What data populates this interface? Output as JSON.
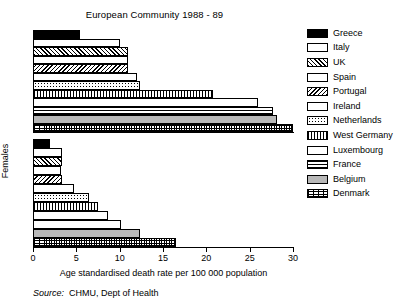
{
  "chart_data": {
    "type": "bar",
    "orientation": "horizontal",
    "title": "European Community 1988 - 89",
    "xlabel": "Age standardised death rate per 100 000 population",
    "ylabel": "",
    "xlim": [
      0,
      30
    ],
    "xticks": [
      0,
      5,
      10,
      15,
      20,
      25,
      30
    ],
    "xtick_labels": [
      "0",
      "5",
      "10",
      "15",
      "20",
      "25",
      "30"
    ],
    "grid": false,
    "legend_position": "right",
    "categories": [
      "Greece",
      "Italy",
      "UK",
      "Spain",
      "Portugal",
      "Ireland",
      "Netherlands",
      "West Germany",
      "Luxembourg",
      "France",
      "Belgium",
      "Denmark"
    ],
    "panels": [
      {
        "name": "Males",
        "label": "Males",
        "values": [
          5.4,
          10.0,
          11.0,
          11.0,
          11.0,
          12.0,
          12.4,
          20.8,
          26.0,
          27.7,
          28.2,
          30.0
        ]
      },
      {
        "name": "Females",
        "label": "Females",
        "values": [
          2.0,
          3.3,
          3.3,
          3.2,
          3.3,
          4.7,
          6.5,
          7.5,
          8.7,
          10.2,
          12.4,
          16.5
        ]
      }
    ],
    "series": [
      {
        "name": "Males",
        "values": [
          5.4,
          10.0,
          11.0,
          11.0,
          11.0,
          12.0,
          12.4,
          20.8,
          26.0,
          27.7,
          28.2,
          30.0
        ]
      },
      {
        "name": "Females",
        "values": [
          2.0,
          3.3,
          3.3,
          3.2,
          3.3,
          4.7,
          6.5,
          7.5,
          8.7,
          10.2,
          12.4,
          16.5
        ]
      }
    ],
    "annotations": [
      "Source:  CHMU, Dept of Health"
    ]
  },
  "legend": {
    "items": [
      {
        "label": "Greece",
        "pattern": "solid-black"
      },
      {
        "label": "Italy",
        "pattern": "white"
      },
      {
        "label": "UK",
        "pattern": "diagonal-hatch"
      },
      {
        "label": "Spain",
        "pattern": "fine-dots"
      },
      {
        "label": "Portugal",
        "pattern": "back-diagonal-hatch"
      },
      {
        "label": "Ireland",
        "pattern": "fine-grid"
      },
      {
        "label": "Netherlands",
        "pattern": "coarse-dots"
      },
      {
        "label": "West Germany",
        "pattern": "vertical-lines"
      },
      {
        "label": "Luxembourg",
        "pattern": "fine-vertical"
      },
      {
        "label": "France",
        "pattern": "horizontal-lines"
      },
      {
        "label": "Belgium",
        "pattern": "solid-gray"
      },
      {
        "label": "Denmark",
        "pattern": "crosshatch"
      }
    ]
  },
  "source": {
    "prefix": "Source:",
    "text": "CHMU, Dept of Health"
  }
}
